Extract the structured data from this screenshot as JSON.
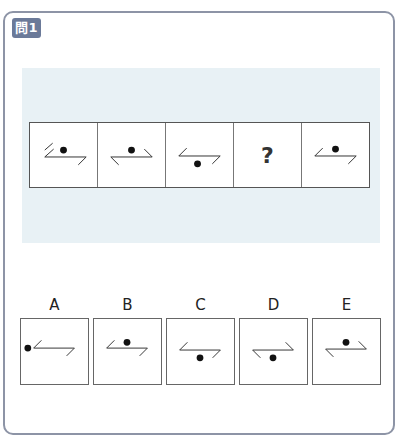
{
  "question": {
    "badge": "問1"
  },
  "sequence": [
    {
      "type": "figure",
      "figure": "seq1"
    },
    {
      "type": "figure",
      "figure": "seq2"
    },
    {
      "type": "figure",
      "figure": "seq3"
    },
    {
      "type": "unknown",
      "label": "?"
    },
    {
      "type": "figure",
      "figure": "seq5"
    }
  ],
  "options": [
    {
      "label": "A"
    },
    {
      "label": "B"
    },
    {
      "label": "C"
    },
    {
      "label": "D"
    },
    {
      "label": "E"
    }
  ],
  "colors": {
    "badge": "#6b7a99",
    "band": "#e8f1f5",
    "border": "#8d94a6"
  }
}
